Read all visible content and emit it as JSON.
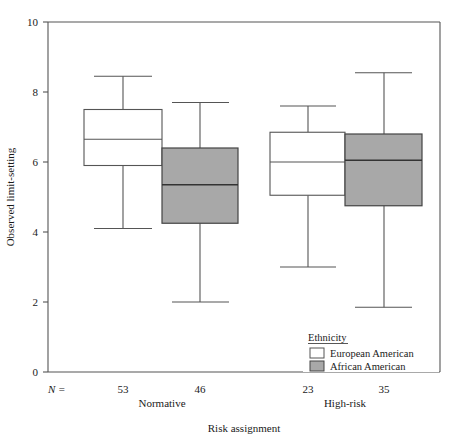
{
  "chart_data": {
    "type": "box",
    "title": "",
    "xlabel": "Risk assignment",
    "ylabel": "Observed limit-setting",
    "ylim": [
      0,
      10
    ],
    "yticks": [
      0,
      2,
      4,
      6,
      8,
      10
    ],
    "ytick_labels": [
      "0",
      "2",
      "4",
      "6",
      "8",
      "10"
    ],
    "grid": false,
    "categories": [
      "Normative",
      "High-risk"
    ],
    "legend": {
      "title": "Ethnicity",
      "position": "inside-bottom-right",
      "entries": [
        {
          "name": "European American",
          "color": "#ffffff"
        },
        {
          "name": "African American",
          "color": "#a8a8a8"
        }
      ]
    },
    "n_prefix": "N =",
    "series": [
      {
        "name": "European American",
        "color": "#ffffff",
        "boxes": [
          {
            "category": "Normative",
            "n": 53,
            "whisker_low": 4.1,
            "q1": 5.9,
            "median": 6.65,
            "q3": 7.5,
            "whisker_high": 8.45
          },
          {
            "category": "High-risk",
            "n": 23,
            "whisker_low": 3.0,
            "q1": 5.05,
            "median": 6.0,
            "q3": 6.85,
            "whisker_high": 7.6
          }
        ]
      },
      {
        "name": "African American",
        "color": "#a8a8a8",
        "boxes": [
          {
            "category": "Normative",
            "n": 46,
            "whisker_low": 2.0,
            "q1": 4.25,
            "median": 5.35,
            "q3": 6.4,
            "whisker_high": 7.7
          },
          {
            "category": "High-risk",
            "n": 35,
            "whisker_low": 1.85,
            "q1": 4.75,
            "median": 6.05,
            "q3": 6.8,
            "whisker_high": 8.55
          }
        ]
      }
    ],
    "n_values": [
      "53",
      "46",
      "23",
      "35"
    ]
  }
}
